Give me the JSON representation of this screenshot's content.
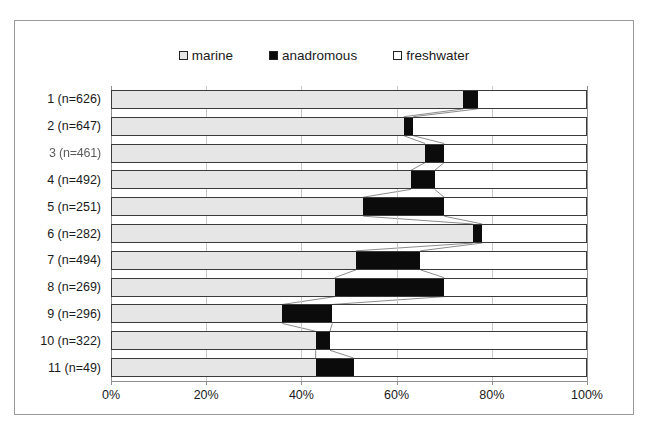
{
  "chart_data": {
    "type": "bar",
    "orientation": "horizontal",
    "stacked": "100%",
    "title": "",
    "xlabel": "",
    "ylabel": "",
    "xlim": [
      0,
      100
    ],
    "grid": true,
    "legend_position": "top-center",
    "xticks": [
      "0%",
      "20%",
      "40%",
      "60%",
      "80%",
      "100%"
    ],
    "xtick_values": [
      0,
      20,
      40,
      60,
      80,
      100
    ],
    "categories": [
      "1 (n=626)",
      "2 (n=647)",
      "3 (n=461)",
      "4 (n=492)",
      "5 (n=251)",
      "6 (n=282)",
      "7 (n=494)",
      "8 (n=269)",
      "9 (n=296)",
      "10 (n=322)",
      "11 (n=49)"
    ],
    "series": [
      {
        "name": "marine",
        "color": "#e6e6e6",
        "values": [
          74.0,
          61.5,
          66.0,
          63.0,
          53.0,
          76.0,
          51.5,
          47.0,
          36.0,
          43.0,
          43.0
        ]
      },
      {
        "name": "anadromous",
        "color": "#0b0b0b",
        "values": [
          3.0,
          2.0,
          4.0,
          5.0,
          17.0,
          2.0,
          13.5,
          23.0,
          10.5,
          3.0,
          8.0
        ]
      },
      {
        "name": "freshwater",
        "color": "#ffffff",
        "values": [
          23.0,
          36.5,
          30.0,
          32.0,
          30.0,
          22.0,
          35.0,
          30.0,
          53.5,
          54.0,
          49.0
        ]
      }
    ],
    "legend": [
      {
        "label": "marine",
        "swatch": "#e6e6e6"
      },
      {
        "label": "anadromous",
        "swatch": "#0b0b0b"
      },
      {
        "label": "freshwater",
        "swatch": "#ffffff"
      }
    ]
  }
}
